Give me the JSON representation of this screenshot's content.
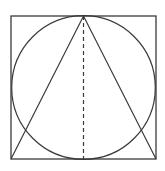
{
  "diagram": {
    "stroke_color": "#3a3a3a",
    "background": "#ffffff",
    "square": {
      "x": 11,
      "y": 16,
      "width": 145,
      "height": 143
    },
    "circle": {
      "cx": 83.5,
      "cy": 87.5,
      "r": 72
    },
    "triangle": {
      "apex": [
        83.5,
        16
      ],
      "base_left": [
        11,
        159
      ],
      "base_right": [
        156,
        159
      ]
    },
    "altitude": {
      "from": [
        83.5,
        16
      ],
      "to": [
        83.5,
        159
      ],
      "style": "dashed"
    }
  }
}
